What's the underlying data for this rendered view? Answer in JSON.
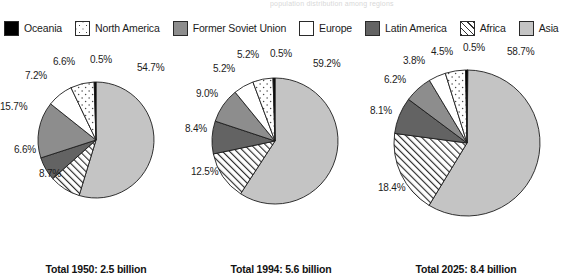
{
  "top_title": "population distribution among regions",
  "legend": {
    "items": [
      {
        "label": "Oceania",
        "key": "oceania",
        "fill": "#000000",
        "pattern": "solid-black"
      },
      {
        "label": "North America",
        "key": "northamerica",
        "fill": "#ffffff",
        "pattern": "sparse-dots"
      },
      {
        "label": "Former Soviet Union",
        "key": "fsu",
        "fill": "#8d8d8d",
        "pattern": "solid-medium-gray"
      },
      {
        "label": "Europe",
        "key": "europe",
        "fill": "#ffffff",
        "pattern": "blank-white"
      },
      {
        "label": "Latin America",
        "key": "latin",
        "fill": "#636363",
        "pattern": "solid-dark-gray"
      },
      {
        "label": "Africa",
        "key": "africa",
        "fill": "#ffffff",
        "pattern": "diagonal-hatch"
      },
      {
        "label": "Asia",
        "key": "asia",
        "fill": "#c4c4c4",
        "pattern": "solid-light-gray"
      }
    ]
  },
  "chart_data": [
    {
      "type": "pie",
      "title": "Total 1950: 2.5 billion",
      "year": 1950,
      "total": "2.5 billion",
      "legend_position": "top",
      "categories": [
        "Oceania",
        "North America",
        "Former Soviet Union",
        "Europe",
        "Latin America",
        "Africa",
        "Asia"
      ],
      "slices": [
        {
          "label": "Asia",
          "value": 54.7,
          "display": "54.7%",
          "key": "asia"
        },
        {
          "label": "Africa",
          "value": 8.7,
          "display": "8.7%",
          "key": "africa"
        },
        {
          "label": "Latin America",
          "value": 6.6,
          "display": "6.6%",
          "key": "latin"
        },
        {
          "label": "Former Soviet Union",
          "value": 15.7,
          "display": "15.7%",
          "key": "fsu"
        },
        {
          "label": "Europe",
          "value": 7.2,
          "display": "7.2%",
          "key": "europe"
        },
        {
          "label": "North America",
          "value": 6.6,
          "display": "6.6%",
          "key": "northamerica"
        },
        {
          "label": "Oceania",
          "value": 0.5,
          "display": "0.5%",
          "key": "oceania"
        }
      ]
    },
    {
      "type": "pie",
      "title": "Total 1994: 5.6 billion",
      "year": 1994,
      "total": "5.6 billion",
      "legend_position": "top",
      "categories": [
        "Oceania",
        "North America",
        "Former Soviet Union",
        "Europe",
        "Latin America",
        "Africa",
        "Asia"
      ],
      "slices": [
        {
          "label": "Asia",
          "value": 59.2,
          "display": "59.2%",
          "key": "asia"
        },
        {
          "label": "Africa",
          "value": 12.5,
          "display": "12.5%",
          "key": "africa"
        },
        {
          "label": "Latin America",
          "value": 8.4,
          "display": "8.4%",
          "key": "latin"
        },
        {
          "label": "Former Soviet Union",
          "value": 9.0,
          "display": "9.0%",
          "key": "fsu"
        },
        {
          "label": "Europe",
          "value": 5.2,
          "display": "5.2%",
          "key": "europe"
        },
        {
          "label": "North America",
          "value": 5.2,
          "display": "5.2%",
          "key": "northamerica"
        },
        {
          "label": "Oceania",
          "value": 0.5,
          "display": "0.5%",
          "key": "oceania"
        }
      ]
    },
    {
      "type": "pie",
      "title": "Total 2025: 8.4 billion",
      "year": 2025,
      "total": "8.4 billion",
      "legend_position": "top",
      "categories": [
        "Oceania",
        "North America",
        "Former Soviet Union",
        "Europe",
        "Latin America",
        "Africa",
        "Asia"
      ],
      "slices": [
        {
          "label": "Asia",
          "value": 58.7,
          "display": "58.7%",
          "key": "asia"
        },
        {
          "label": "Africa",
          "value": 18.4,
          "display": "18.4%",
          "key": "africa"
        },
        {
          "label": "Latin America",
          "value": 8.1,
          "display": "8.1%",
          "key": "latin"
        },
        {
          "label": "Former Soviet Union",
          "value": 6.2,
          "display": "6.2%",
          "key": "fsu"
        },
        {
          "label": "Europe",
          "value": 3.8,
          "display": "3.8%",
          "key": "europe"
        },
        {
          "label": "North America",
          "value": 4.5,
          "display": "4.5%",
          "key": "northamerica"
        },
        {
          "label": "Oceania",
          "value": 0.5,
          "display": "0.5%",
          "key": "oceania"
        }
      ]
    }
  ],
  "pies": [
    {
      "caption": "Total 1950: 2.5 billion",
      "radius": 58,
      "cx": 96,
      "cy": 96,
      "labels": [
        {
          "text": "54.7%",
          "x": 137,
          "y": 18
        },
        {
          "text": "0.5%",
          "x": 90,
          "y": 10
        },
        {
          "text": "6.6%",
          "x": 53,
          "y": 12
        },
        {
          "text": "7.2%",
          "x": 25,
          "y": 26
        },
        {
          "text": "15.7%",
          "x": 0,
          "y": 57
        },
        {
          "text": "6.6%",
          "x": 14,
          "y": 100
        },
        {
          "text": "8.7%",
          "x": 39,
          "y": 124
        }
      ]
    },
    {
      "caption": "Total 1994: 5.6 billion",
      "radius": 63,
      "cx": 90,
      "cy": 97,
      "labels": [
        {
          "text": "59.2%",
          "x": 128,
          "y": 14
        },
        {
          "text": "0.5%",
          "x": 85,
          "y": 4
        },
        {
          "text": "5.2%",
          "x": 52,
          "y": 5
        },
        {
          "text": "5.2%",
          "x": 28,
          "y": 19
        },
        {
          "text": "9.0%",
          "x": 11,
          "y": 44
        },
        {
          "text": "8.4%",
          "x": 0,
          "y": 79
        },
        {
          "text": "12.5%",
          "x": 6,
          "y": 122
        }
      ]
    },
    {
      "caption": "Total 2025: 8.4 billion",
      "radius": 73,
      "cx": 97,
      "cy": 99,
      "labels": [
        {
          "text": "58.7%",
          "x": 137,
          "y": 2
        },
        {
          "text": "0.5%",
          "x": 93,
          "y": -2
        },
        {
          "text": "4.5%",
          "x": 61,
          "y": 2
        },
        {
          "text": "3.8%",
          "x": 33,
          "y": 11
        },
        {
          "text": "6.2%",
          "x": 14,
          "y": 30
        },
        {
          "text": "8.1%",
          "x": 0,
          "y": 61
        },
        {
          "text": "18.4%",
          "x": 8,
          "y": 138
        }
      ]
    }
  ]
}
